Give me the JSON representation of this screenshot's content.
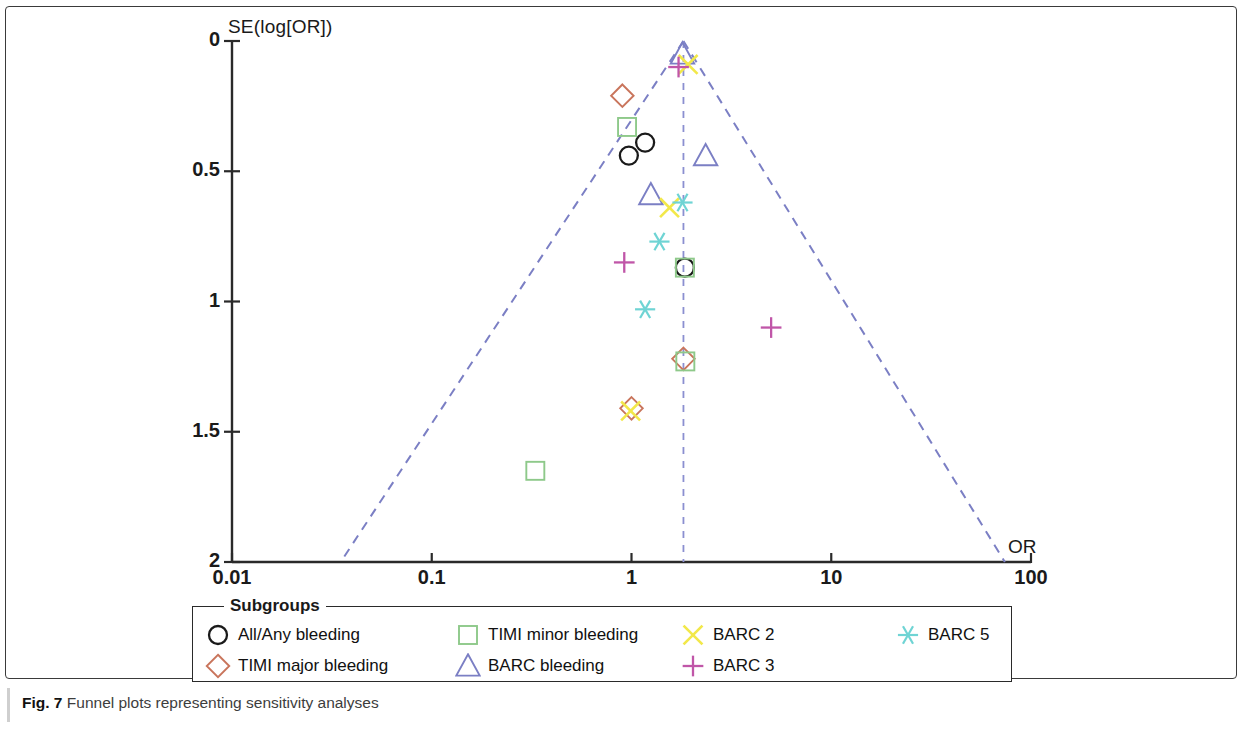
{
  "figure": {
    "caption_prefix": "Fig. 7",
    "caption_text": "Funnel plots representing sensitivity analyses"
  },
  "axes": {
    "y_axis_label": "SE(log[OR])",
    "x_axis_label": "OR",
    "y_ticks": [
      "0",
      "0.5",
      "1",
      "1.5",
      "2"
    ],
    "x_ticks": [
      "0.01",
      "0.1",
      "1",
      "10",
      "100"
    ]
  },
  "legend": {
    "title": "Subgroups",
    "items": [
      {
        "label": "All/Any bleeding",
        "marker": "circle",
        "color": "#1a1a1a",
        "icon": "circle-marker-icon"
      },
      {
        "label": "TIMI minor bleeding",
        "marker": "square",
        "color": "#8ec98a",
        "icon": "square-marker-icon"
      },
      {
        "label": "BARC 2",
        "marker": "x",
        "color": "#f2e84a",
        "icon": "x-marker-icon"
      },
      {
        "label": "BARC 5",
        "marker": "asterisk",
        "color": "#6fd4d4",
        "icon": "asterisk-marker-icon"
      },
      {
        "label": "TIMI major bleeding",
        "marker": "diamond",
        "color": "#c9755c",
        "icon": "diamond-marker-icon"
      },
      {
        "label": "BARC bleeding",
        "marker": "triangle",
        "color": "#7b7fc4",
        "icon": "triangle-marker-icon"
      },
      {
        "label": "BARC 3",
        "marker": "plus",
        "color": "#c056a8",
        "icon": "plus-marker-icon"
      }
    ]
  },
  "colors": {
    "axis": "#2a2a2a",
    "funnel_line": "#7b7fc4",
    "center_line": "#8b8fd0",
    "circle": "#1a1a1a",
    "diamond": "#c9755c",
    "square": "#8ec98a",
    "triangle": "#7b7fc4",
    "x_marker": "#f2e84a",
    "plus": "#c056a8",
    "asterisk": "#6fd4d4"
  },
  "chart_data": {
    "type": "scatter",
    "title": "Funnel plots representing sensitivity analyses",
    "xlabel": "OR",
    "ylabel": "SE(log[OR])",
    "x_scale": "log",
    "xlim": [
      0.01,
      100
    ],
    "ylim": [
      0,
      2
    ],
    "y_axis_inverted": true,
    "grid": false,
    "legend_position": "bottom",
    "funnel": {
      "apex_or": 1.82,
      "apex_se": 0.0,
      "left_base_or": 0.035,
      "right_base_or": 74.0,
      "base_se": 2.0,
      "center_line_or": 1.82,
      "line_style": "dashed"
    },
    "series": [
      {
        "name": "All/Any bleeding",
        "marker": "circle",
        "color": "#1a1a1a",
        "points": [
          {
            "or": 0.97,
            "se": 0.44
          },
          {
            "or": 1.17,
            "se": 0.39
          },
          {
            "or": 1.85,
            "se": 0.87
          }
        ]
      },
      {
        "name": "TIMI major bleeding",
        "marker": "diamond",
        "color": "#c9755c",
        "points": [
          {
            "or": 0.9,
            "se": 0.21
          },
          {
            "or": 1.0,
            "se": 1.41
          },
          {
            "or": 1.82,
            "se": 1.22
          }
        ]
      },
      {
        "name": "TIMI minor bleeding",
        "marker": "square",
        "color": "#8ec98a",
        "points": [
          {
            "or": 0.95,
            "se": 0.33
          },
          {
            "or": 1.85,
            "se": 0.87
          },
          {
            "or": 1.86,
            "se": 1.23
          },
          {
            "or": 0.33,
            "se": 1.65
          }
        ]
      },
      {
        "name": "BARC bleeding",
        "marker": "triangle",
        "color": "#7b7fc4",
        "points": [
          {
            "or": 1.8,
            "se": 0.05
          },
          {
            "or": 1.25,
            "se": 0.59
          },
          {
            "or": 2.35,
            "se": 0.44
          }
        ]
      },
      {
        "name": "BARC 2",
        "marker": "x",
        "color": "#f2e84a",
        "points": [
          {
            "or": 1.92,
            "se": 0.09
          },
          {
            "or": 1.55,
            "se": 0.64
          },
          {
            "or": 0.99,
            "se": 1.42
          }
        ]
      },
      {
        "name": "BARC 3",
        "marker": "plus",
        "color": "#c056a8",
        "points": [
          {
            "or": 1.72,
            "se": 0.1
          },
          {
            "or": 0.92,
            "se": 0.85
          },
          {
            "or": 5.0,
            "se": 1.1
          }
        ]
      },
      {
        "name": "BARC 5",
        "marker": "asterisk",
        "color": "#6fd4d4",
        "points": [
          {
            "or": 1.8,
            "se": 0.62
          },
          {
            "or": 1.38,
            "se": 0.77
          },
          {
            "or": 1.17,
            "se": 1.03
          }
        ]
      }
    ]
  }
}
